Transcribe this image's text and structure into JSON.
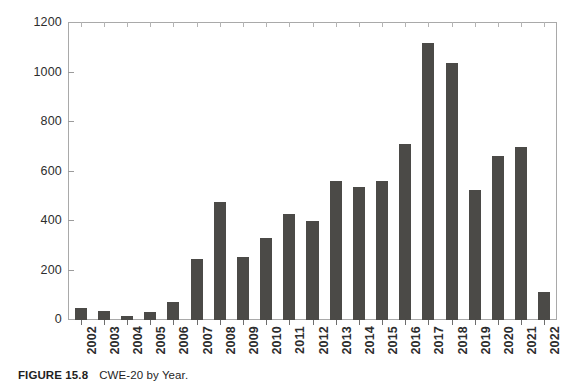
{
  "caption": {
    "figure_number": "FIGURE 15.8",
    "title": "CWE-20 by Year."
  },
  "colors": {
    "bar_fill": "#4b4a47",
    "axis": "#a9a9a9",
    "text": "#2d2d2d",
    "background": "#ffffff"
  },
  "chart_data": {
    "type": "bar",
    "title": "CWE-20 by Year.",
    "xlabel": "",
    "ylabel": "",
    "ylim": [
      0,
      1200
    ],
    "yticks": [
      0,
      200,
      400,
      600,
      800,
      1000,
      1200
    ],
    "ytick_labels": [
      "0",
      "200",
      "400",
      "600",
      "800",
      "1000",
      "1200"
    ],
    "grid": false,
    "legend": false,
    "xtick_rotation": -90,
    "categories": [
      "2002",
      "2003",
      "2004",
      "2005",
      "2006",
      "2007",
      "2008",
      "2009",
      "2010",
      "2011",
      "2012",
      "2013",
      "2014",
      "2015",
      "2016",
      "2017",
      "2018",
      "2019",
      "2020",
      "2021",
      "2022"
    ],
    "values": [
      50,
      35,
      18,
      32,
      72,
      248,
      478,
      255,
      330,
      430,
      400,
      563,
      537,
      563,
      712,
      1120,
      1040,
      524,
      661,
      700,
      115
    ]
  }
}
